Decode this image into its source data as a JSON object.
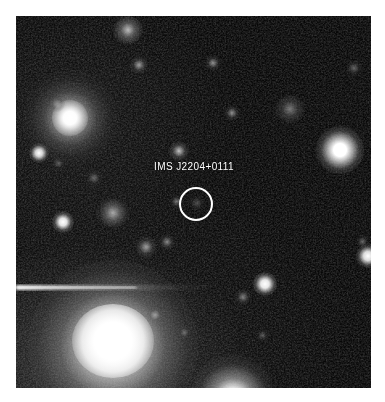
{
  "figure": {
    "kind": "astronomical-finding-chart",
    "border_color": "#ffffff",
    "background_color": "#070707",
    "frame": {
      "x": 16,
      "y": 16,
      "width": 355,
      "height": 372
    }
  },
  "annotation": {
    "target_label": "IMS J2204+0111",
    "label_color": "#ffffff",
    "label_font_size_px": 10,
    "label_x": 194,
    "label_y": 171,
    "circle_color": "#ffffff",
    "circle_center_x": 196,
    "circle_center_y": 204,
    "circle_radius": 17,
    "circle_stroke_px": 2
  },
  "chart_data": {
    "type": "scatter",
    "title": "IMS J2204+0111",
    "xlabel": "",
    "ylabel": "",
    "xlim": [
      0,
      355
    ],
    "ylim": [
      0,
      372
    ],
    "grid": false,
    "legend": "none",
    "annotations": [
      {
        "text": "IMS J2204+0111",
        "x": 178,
        "y": 155,
        "color": "#ffffff"
      },
      {
        "text": "target circle",
        "x": 180,
        "y": 188,
        "r": 17,
        "color": "#ffffff"
      }
    ],
    "sources": [
      {
        "name": "spiral-galaxy-upper-left",
        "x": 54,
        "y": 102,
        "r": 36,
        "peak": 1.0,
        "kind": "galaxy"
      },
      {
        "name": "spiral-galaxy-upper-left-core",
        "x": 54,
        "y": 102,
        "r": 13,
        "peak": 1.0,
        "kind": "core"
      },
      {
        "name": "bright-elliptical-lower-left",
        "x": 97,
        "y": 329,
        "r": 62,
        "peak": 1.0,
        "kind": "galaxy"
      },
      {
        "name": "bright-elliptical-lower-left-core",
        "x": 97,
        "y": 329,
        "r": 26,
        "peak": 1.0,
        "kind": "core"
      },
      {
        "name": "star-right-bright",
        "x": 324,
        "y": 134,
        "r": 13,
        "peak": 1.0,
        "kind": "star"
      },
      {
        "name": "star-bottom-edge",
        "x": 217,
        "y": 372,
        "r": 17,
        "peak": 1.0,
        "kind": "star"
      },
      {
        "name": "star-left-mid",
        "x": 47,
        "y": 206,
        "r": 7,
        "peak": 0.85,
        "kind": "star"
      },
      {
        "name": "star-upper-left-small",
        "x": 23,
        "y": 137,
        "r": 6,
        "peak": 0.8,
        "kind": "star"
      },
      {
        "name": "star-mid-right",
        "x": 249,
        "y": 268,
        "r": 8,
        "peak": 0.92,
        "kind": "star"
      },
      {
        "name": "star-right-edge",
        "x": 351,
        "y": 239,
        "r": 8,
        "peak": 0.9,
        "kind": "star"
      },
      {
        "name": "galaxy-center-left",
        "x": 96,
        "y": 196,
        "r": 14,
        "peak": 0.45,
        "kind": "galaxy"
      },
      {
        "name": "galaxy-upper-mid",
        "x": 111,
        "y": 14,
        "r": 9,
        "peak": 0.55,
        "kind": "galaxy"
      },
      {
        "name": "galaxy-upper-right",
        "x": 273,
        "y": 93,
        "r": 11,
        "peak": 0.35,
        "kind": "galaxy"
      },
      {
        "name": "faint-source-a",
        "x": 124,
        "y": 50,
        "r": 6,
        "peak": 0.3,
        "kind": "faint"
      },
      {
        "name": "faint-source-b",
        "x": 197,
        "y": 47,
        "r": 5,
        "peak": 0.28,
        "kind": "faint"
      },
      {
        "name": "faint-source-c",
        "x": 216,
        "y": 97,
        "r": 5,
        "peak": 0.3,
        "kind": "faint"
      },
      {
        "name": "faint-source-d",
        "x": 163,
        "y": 135,
        "r": 6,
        "peak": 0.42,
        "kind": "faint"
      },
      {
        "name": "faint-source-e",
        "x": 130,
        "y": 231,
        "r": 7,
        "peak": 0.38,
        "kind": "faint"
      },
      {
        "name": "faint-source-f",
        "x": 151,
        "y": 226,
        "r": 5,
        "peak": 0.3,
        "kind": "faint"
      },
      {
        "name": "faint-source-g",
        "x": 160,
        "y": 185,
        "r": 4,
        "peak": 0.26,
        "kind": "faint"
      },
      {
        "name": "faint-source-h",
        "x": 139,
        "y": 299,
        "r": 5,
        "peak": 0.32,
        "kind": "faint"
      },
      {
        "name": "faint-source-i",
        "x": 227,
        "y": 281,
        "r": 5,
        "peak": 0.28,
        "kind": "faint"
      },
      {
        "name": "faint-source-j",
        "x": 41,
        "y": 88,
        "r": 5,
        "peak": 0.25,
        "kind": "faint"
      },
      {
        "name": "faint-source-k",
        "x": 338,
        "y": 52,
        "r": 5,
        "peak": 0.22,
        "kind": "faint"
      },
      {
        "name": "faint-source-l",
        "x": 347,
        "y": 226,
        "r": 4,
        "peak": 0.22,
        "kind": "faint"
      },
      {
        "name": "faint-source-m",
        "x": 78,
        "y": 162,
        "r": 5,
        "peak": 0.22,
        "kind": "faint"
      },
      {
        "name": "faint-source-n",
        "x": 43,
        "y": 148,
        "r": 4,
        "peak": 0.2,
        "kind": "faint"
      },
      {
        "name": "faint-source-o",
        "x": 169,
        "y": 317,
        "r": 4,
        "peak": 0.22,
        "kind": "faint"
      },
      {
        "name": "faint-source-p",
        "x": 247,
        "y": 320,
        "r": 4,
        "peak": 0.18,
        "kind": "faint"
      },
      {
        "name": "diffraction-spike-left",
        "x": 0,
        "y": 272,
        "r": 0,
        "peak": 0.9,
        "kind": "spike"
      }
    ]
  }
}
